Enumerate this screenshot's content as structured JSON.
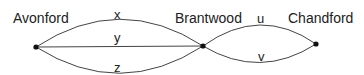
{
  "nodes": [
    {
      "id": "A",
      "label": "Avonford",
      "x": 36,
      "y": 47
    },
    {
      "id": "B",
      "label": "Brantwood",
      "x": 203,
      "y": 46
    },
    {
      "id": "C",
      "label": "Chandford",
      "x": 316,
      "y": 44
    }
  ],
  "edges": [
    {
      "label": "x",
      "from": "Avonford",
      "to": "Brantwood"
    },
    {
      "label": "y",
      "from": "Avonford",
      "to": "Brantwood"
    },
    {
      "label": "z",
      "from": "Avonford",
      "to": "Brantwood"
    },
    {
      "label": "u",
      "from": "Brantwood",
      "to": "Chandford"
    },
    {
      "label": "v",
      "from": "Brantwood",
      "to": "Chandford"
    }
  ]
}
